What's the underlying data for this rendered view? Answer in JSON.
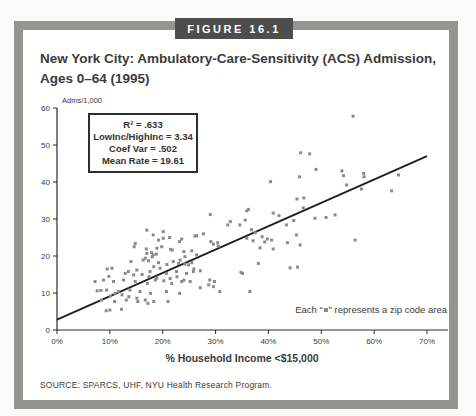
{
  "figure": {
    "label": "FIGURE 16.1",
    "title_line1": "New York City: Ambulatory-Care-Sensitivity (ACS) Admission,",
    "title_line2": "Ages 0–64 (1995)",
    "source": "SOURCE: SPARCS, UHF, NYU Health Research Program."
  },
  "stats_box": {
    "lines": [
      "R² = .633",
      "LowInc/HighInc = 3.34",
      "Coef Var = .502",
      "Mean Rate = 19.61"
    ]
  },
  "annotation": {
    "prefix": "Each “",
    "suffix": "” represents a zip code area"
  },
  "colors": {
    "frame_border": "#95948e",
    "tag_background": "#4d4d4b",
    "text": "#3b3b3b",
    "axis": "#2b2b2b",
    "trend_line": "#1f1f1f",
    "point": "#8b8b8b"
  },
  "chart_data": {
    "type": "scatter",
    "title": "New York City: Ambulatory-Care-Sensitivity (ACS) Admission, Ages 0–64 (1995)",
    "xlabel": "% Household Income <$15,000",
    "ylabel": "Adms/1,000",
    "xlim": [
      0,
      70
    ],
    "ylim": [
      0,
      60
    ],
    "grid": false,
    "legend": "none",
    "marker": "square",
    "x_tick_values": [
      0,
      10,
      20,
      30,
      40,
      50,
      60,
      70
    ],
    "x_tick_labels": [
      "0%",
      "10%",
      "20%",
      "30%",
      "40%",
      "50%",
      "60%",
      "70%"
    ],
    "y_tick_values": [
      0,
      10,
      20,
      30,
      40,
      50,
      60
    ],
    "y_tick_labels": [
      "0",
      "10",
      "20",
      "30",
      "40",
      "50",
      "60"
    ],
    "trend_line": {
      "x1": 0,
      "y1": 2.8,
      "x2": 70,
      "y2": 47.0
    },
    "stats": {
      "r_squared": 0.633,
      "lowinc_highinc_ratio": 3.34,
      "coef_var": 0.502,
      "mean_rate": 19.61
    },
    "points": [
      [
        7.2,
        13.1
      ],
      [
        7.6,
        10.6
      ],
      [
        8.3,
        10.7
      ],
      [
        8.4,
        8.1
      ],
      [
        8.8,
        13.5
      ],
      [
        9.3,
        5.2
      ],
      [
        9.4,
        10.8
      ],
      [
        9.5,
        16.5
      ],
      [
        9.8,
        14.5
      ],
      [
        10.0,
        5.4
      ],
      [
        10.1,
        9.2
      ],
      [
        10.4,
        16.7
      ],
      [
        10.7,
        13.1
      ],
      [
        10.9,
        7.7
      ],
      [
        11.0,
        9.9
      ],
      [
        11.6,
        10.4
      ],
      [
        12.2,
        5.6
      ],
      [
        12.3,
        9.5
      ],
      [
        12.6,
        13.5
      ],
      [
        12.9,
        15.3
      ],
      [
        13.1,
        8.1
      ],
      [
        13.5,
        15.8
      ],
      [
        13.6,
        9.0
      ],
      [
        13.8,
        10.8
      ],
      [
        14.0,
        18.5
      ],
      [
        14.5,
        14.9
      ],
      [
        14.6,
        22.5
      ],
      [
        14.8,
        23.4
      ],
      [
        14.8,
        13.1
      ],
      [
        15.1,
        16.2
      ],
      [
        15.1,
        8.6
      ],
      [
        15.3,
        7.7
      ],
      [
        15.7,
        10.4
      ],
      [
        16.1,
        15.0
      ],
      [
        16.3,
        18.9
      ],
      [
        16.7,
        19.4
      ],
      [
        16.7,
        8.1
      ],
      [
        16.9,
        21.9
      ],
      [
        17.0,
        27.0
      ],
      [
        17.0,
        20.7
      ],
      [
        17.1,
        12.6
      ],
      [
        17.2,
        7.2
      ],
      [
        17.3,
        18.7
      ],
      [
        17.4,
        14.4
      ],
      [
        17.6,
        15.8
      ],
      [
        17.7,
        9.9
      ],
      [
        17.9,
        20.9
      ],
      [
        18.0,
        19.8
      ],
      [
        18.2,
        25.7
      ],
      [
        18.2,
        20.3
      ],
      [
        18.3,
        17.1
      ],
      [
        18.3,
        7.7
      ],
      [
        18.6,
        13.5
      ],
      [
        18.8,
        20.5
      ],
      [
        18.9,
        22.1
      ],
      [
        18.9,
        14.0
      ],
      [
        19.2,
        24.3
      ],
      [
        19.2,
        18.2
      ],
      [
        19.5,
        16.7
      ],
      [
        19.8,
        22.5
      ],
      [
        20.1,
        26.6
      ],
      [
        20.1,
        24.8
      ],
      [
        20.2,
        13.3
      ],
      [
        20.7,
        15.3
      ],
      [
        20.7,
        10.4
      ],
      [
        20.8,
        17.7
      ],
      [
        21.0,
        7.7
      ],
      [
        21.3,
        25.0
      ],
      [
        21.4,
        13.9
      ],
      [
        21.5,
        21.8
      ],
      [
        21.7,
        12.6
      ],
      [
        21.8,
        21.6
      ],
      [
        22.0,
        18.5
      ],
      [
        22.6,
        15.8
      ],
      [
        22.7,
        14.4
      ],
      [
        23.0,
        18.0
      ],
      [
        23.2,
        23.9
      ],
      [
        23.2,
        9.9
      ],
      [
        23.3,
        18.9
      ],
      [
        23.6,
        24.6
      ],
      [
        23.6,
        13.1
      ],
      [
        24.0,
        21.2
      ],
      [
        24.0,
        13.5
      ],
      [
        24.2,
        19.8
      ],
      [
        24.2,
        17.8
      ],
      [
        24.5,
        15.3
      ],
      [
        24.9,
        17.6
      ],
      [
        25.2,
        13.1
      ],
      [
        25.5,
        21.4
      ],
      [
        25.5,
        18.2
      ],
      [
        25.8,
        15.8
      ],
      [
        25.9,
        16.5
      ],
      [
        26.1,
        25.4
      ],
      [
        26.4,
        25.5
      ],
      [
        26.4,
        20.3
      ],
      [
        27.1,
        16.0
      ],
      [
        27.1,
        11.4
      ],
      [
        27.7,
        26.0
      ],
      [
        28.7,
        12.2
      ],
      [
        28.9,
        13.5
      ],
      [
        29.0,
        31.2
      ],
      [
        29.1,
        23.9
      ],
      [
        29.6,
        23.2
      ],
      [
        29.6,
        11.7
      ],
      [
        29.8,
        13.1
      ],
      [
        30.4,
        23.6
      ],
      [
        30.5,
        22.7
      ],
      [
        30.8,
        10.4
      ],
      [
        32.3,
        28.4
      ],
      [
        32.8,
        29.3
      ],
      [
        34.6,
        28.4
      ],
      [
        34.8,
        15.6
      ],
      [
        35.1,
        15.3
      ],
      [
        35.6,
        29.7
      ],
      [
        35.9,
        32.2
      ],
      [
        35.9,
        24.8
      ],
      [
        36.2,
        32.6
      ],
      [
        36.5,
        10.4
      ],
      [
        36.8,
        27.1
      ],
      [
        37.1,
        24.1
      ],
      [
        37.5,
        26.3
      ],
      [
        38.1,
        18.0
      ],
      [
        38.4,
        22.2
      ],
      [
        38.8,
        25.2
      ],
      [
        39.3,
        23.8
      ],
      [
        39.8,
        24.6
      ],
      [
        40.4,
        40.1
      ],
      [
        40.6,
        24.3
      ],
      [
        40.9,
        31.6
      ],
      [
        40.9,
        21.9
      ],
      [
        42.0,
        30.9
      ],
      [
        43.4,
        28.4
      ],
      [
        43.6,
        23.6
      ],
      [
        44.1,
        16.8
      ],
      [
        44.8,
        29.6
      ],
      [
        45.3,
        25.7
      ],
      [
        45.4,
        35.4
      ],
      [
        45.5,
        17.0
      ],
      [
        45.9,
        41.4
      ],
      [
        46.0,
        23.0
      ],
      [
        46.1,
        47.9
      ],
      [
        46.6,
        33.0
      ],
      [
        46.7,
        35.7
      ],
      [
        47.8,
        47.6
      ],
      [
        48.8,
        30.2
      ],
      [
        49.0,
        43.4
      ],
      [
        50.9,
        30.4
      ],
      [
        52.6,
        31.1
      ],
      [
        53.9,
        43.0
      ],
      [
        54.2,
        41.7
      ],
      [
        54.8,
        39.2
      ],
      [
        56.0,
        57.8
      ],
      [
        56.4,
        24.3
      ],
      [
        57.6,
        38.1
      ],
      [
        58.0,
        42.3
      ],
      [
        58.1,
        41.4
      ],
      [
        63.3,
        37.6
      ],
      [
        64.6,
        41.9
      ]
    ]
  }
}
